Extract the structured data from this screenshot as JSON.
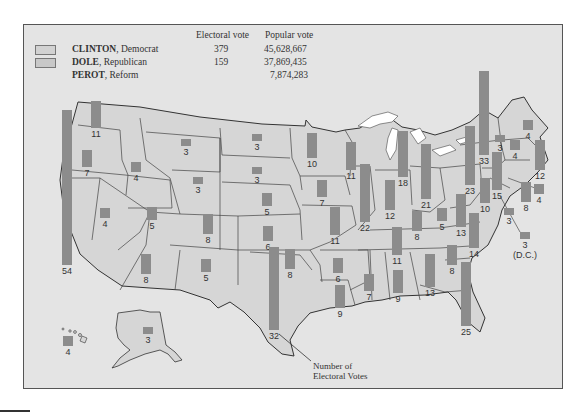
{
  "legend": {
    "headers": {
      "electoral": "Electoral vote",
      "popular": "Popular vote"
    },
    "candidates": [
      {
        "name": "CLINTON",
        "party": ", Democrat",
        "electoral": "379",
        "popular": "45,628,667",
        "swatch": true
      },
      {
        "name": "DOLE",
        "party": ", Republican",
        "electoral": "159",
        "popular": "37,869,435",
        "swatch": true
      },
      {
        "name": "PEROT",
        "party": ", Reform",
        "electoral": "",
        "popular": "7,874,283",
        "swatch": false
      }
    ]
  },
  "colors": {
    "background": "#e4e4e4",
    "state_fill": "#d6d6d6",
    "bar": "#8c8c8c",
    "lakes": "#ffffff",
    "border": "#444444"
  },
  "annotation": {
    "line1": "Number of",
    "line2": "Electoral Votes"
  },
  "states": [
    {
      "state": "WA",
      "ev": "11",
      "x": 91,
      "y": 101,
      "w": 10,
      "h": 27
    },
    {
      "state": "OR",
      "ev": "7",
      "x": 82,
      "y": 150,
      "w": 10,
      "h": 17
    },
    {
      "state": "CA",
      "ev": "54",
      "x": 62,
      "y": 110,
      "w": 10,
      "h": 155
    },
    {
      "state": "ID",
      "ev": "4",
      "x": 131,
      "y": 162,
      "w": 10,
      "h": 10
    },
    {
      "state": "NV",
      "ev": "4",
      "x": 100,
      "y": 208,
      "w": 10,
      "h": 10
    },
    {
      "state": "MT",
      "ev": "3",
      "x": 181,
      "y": 139,
      "w": 10,
      "h": 7
    },
    {
      "state": "WY",
      "ev": "3",
      "x": 193,
      "y": 177,
      "w": 10,
      "h": 7
    },
    {
      "state": "UT",
      "ev": "5",
      "x": 147,
      "y": 207,
      "w": 10,
      "h": 13
    },
    {
      "state": "CO",
      "ev": "8",
      "x": 203,
      "y": 214,
      "w": 10,
      "h": 20
    },
    {
      "state": "AZ",
      "ev": "8",
      "x": 141,
      "y": 254,
      "w": 10,
      "h": 20
    },
    {
      "state": "NM",
      "ev": "5",
      "x": 201,
      "y": 259,
      "w": 10,
      "h": 13
    },
    {
      "state": "ND",
      "ev": "3",
      "x": 252,
      "y": 134,
      "w": 10,
      "h": 7
    },
    {
      "state": "SD",
      "ev": "3",
      "x": 252,
      "y": 167,
      "w": 10,
      "h": 7
    },
    {
      "state": "NE",
      "ev": "5",
      "x": 262,
      "y": 193,
      "w": 10,
      "h": 13
    },
    {
      "state": "KS",
      "ev": "6",
      "x": 263,
      "y": 226,
      "w": 10,
      "h": 15
    },
    {
      "state": "OK",
      "ev": "8",
      "x": 285,
      "y": 249,
      "w": 10,
      "h": 20
    },
    {
      "state": "TX",
      "ev": "32",
      "x": 269,
      "y": 247,
      "w": 10,
      "h": 83
    },
    {
      "state": "MN",
      "ev": "10",
      "x": 307,
      "y": 133,
      "w": 10,
      "h": 25
    },
    {
      "state": "IA",
      "ev": "7",
      "x": 317,
      "y": 180,
      "w": 10,
      "h": 17
    },
    {
      "state": "MO",
      "ev": "11",
      "x": 330,
      "y": 207,
      "w": 10,
      "h": 28
    },
    {
      "state": "AR",
      "ev": "6",
      "x": 333,
      "y": 258,
      "w": 10,
      "h": 15
    },
    {
      "state": "LA",
      "ev": "9",
      "x": 335,
      "y": 285,
      "w": 10,
      "h": 23
    },
    {
      "state": "WI",
      "ev": "11",
      "x": 346,
      "y": 142,
      "w": 10,
      "h": 28
    },
    {
      "state": "IL",
      "ev": "22",
      "x": 360,
      "y": 164,
      "w": 10,
      "h": 58
    },
    {
      "state": "MI",
      "ev": "18",
      "x": 398,
      "y": 131,
      "w": 10,
      "h": 46
    },
    {
      "state": "IN",
      "ev": "12",
      "x": 385,
      "y": 180,
      "w": 10,
      "h": 30
    },
    {
      "state": "OH",
      "ev": "21",
      "x": 421,
      "y": 144,
      "w": 10,
      "h": 55
    },
    {
      "state": "KY",
      "ev": "8",
      "x": 412,
      "y": 211,
      "w": 10,
      "h": 20
    },
    {
      "state": "WV",
      "ev": "5",
      "x": 437,
      "y": 208,
      "w": 10,
      "h": 13
    },
    {
      "state": "TN",
      "ev": "11",
      "x": 392,
      "y": 227,
      "w": 10,
      "h": 28
    },
    {
      "state": "MS",
      "ev": "7",
      "x": 364,
      "y": 274,
      "w": 10,
      "h": 17
    },
    {
      "state": "AL",
      "ev": "9",
      "x": 393,
      "y": 270,
      "w": 10,
      "h": 23
    },
    {
      "state": "GA",
      "ev": "13",
      "x": 425,
      "y": 254,
      "w": 10,
      "h": 33
    },
    {
      "state": "FL",
      "ev": "25",
      "x": 461,
      "y": 262,
      "w": 10,
      "h": 64
    },
    {
      "state": "SC",
      "ev": "8",
      "x": 447,
      "y": 245,
      "w": 10,
      "h": 20
    },
    {
      "state": "NC",
      "ev": "14",
      "x": 469,
      "y": 213,
      "w": 10,
      "h": 35
    },
    {
      "state": "VA",
      "ev": "13",
      "x": 456,
      "y": 194,
      "w": 10,
      "h": 33
    },
    {
      "state": "PA",
      "ev": "23",
      "x": 465,
      "y": 126,
      "w": 10,
      "h": 59
    },
    {
      "state": "NY",
      "ev": "33",
      "x": 479,
      "y": 71,
      "w": 10,
      "h": 84
    },
    {
      "state": "MD",
      "ev": "10",
      "x": 480,
      "y": 178,
      "w": 10,
      "h": 25
    },
    {
      "state": "NJ",
      "ev": "15",
      "x": 492,
      "y": 152,
      "w": 10,
      "h": 38
    },
    {
      "state": "DE",
      "ev": "3",
      "x": 504,
      "y": 208,
      "w": 10,
      "h": 7
    },
    {
      "state": "DC",
      "ev": "3",
      "x": 520,
      "y": 232,
      "w": 10,
      "h": 7,
      "extra": "(D.C.)"
    },
    {
      "state": "VT",
      "ev": "3",
      "x": 495,
      "y": 135,
      "w": 10,
      "h": 7
    },
    {
      "state": "NH",
      "ev": "4",
      "x": 510,
      "y": 140,
      "w": 10,
      "h": 10
    },
    {
      "state": "ME",
      "ev": "4",
      "x": 523,
      "y": 120,
      "w": 10,
      "h": 10
    },
    {
      "state": "MA",
      "ev": "12",
      "x": 535,
      "y": 140,
      "w": 10,
      "h": 30
    },
    {
      "state": "CT",
      "ev": "8",
      "x": 521,
      "y": 182,
      "w": 10,
      "h": 20
    },
    {
      "state": "RI",
      "ev": "4",
      "x": 534,
      "y": 184,
      "w": 10,
      "h": 10
    },
    {
      "state": "AK",
      "ev": "3",
      "x": 143,
      "y": 327,
      "w": 10,
      "h": 7
    },
    {
      "state": "HI",
      "ev": "4",
      "x": 63,
      "y": 336,
      "w": 10,
      "h": 10
    }
  ]
}
